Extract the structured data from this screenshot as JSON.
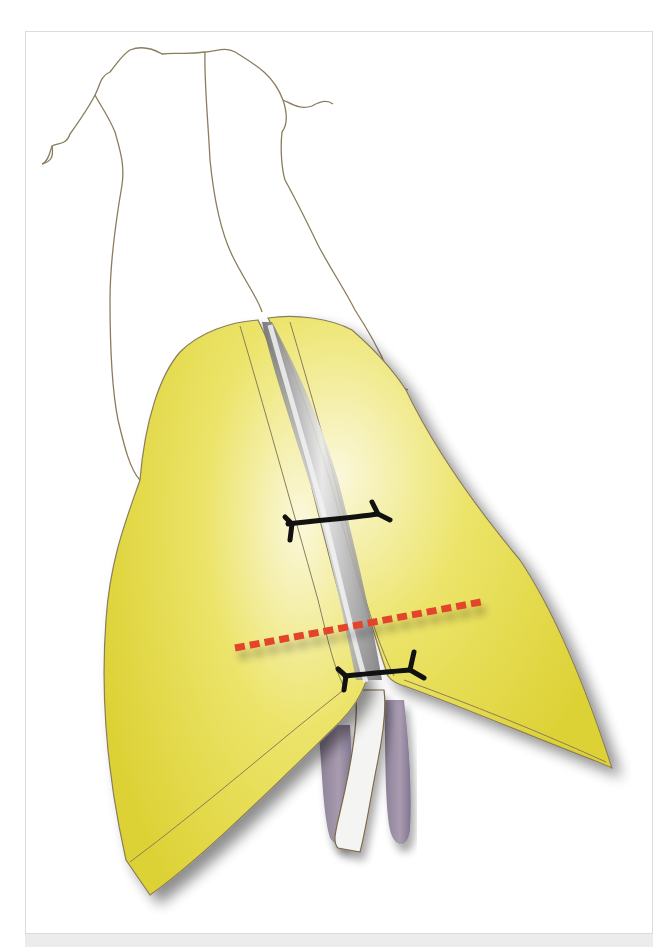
{
  "figure": {
    "colors": {
      "flap_yellow": "#e2d83e",
      "flap_highlight": "#fbf8d8",
      "outline": "#8a7d5e",
      "cleft_gray": "#8c8c8c",
      "suture": "#111111",
      "incision_red": "#e2452a",
      "tissue_purple": "#958aa0",
      "frame_border": "#dcdcdc",
      "caption_strip": "#ececec"
    },
    "elements": {
      "outline_region": "outline-region",
      "left_flap": "left-flap",
      "right_flap": "right-flap",
      "upper_suture": "upper-suture",
      "lower_suture": "lower-suture",
      "incision_line": "dashed-incision-line",
      "left_tissue": "left-tissue-lobe",
      "right_tissue": "right-tissue-lobe",
      "central_strip": "central-strip"
    }
  }
}
